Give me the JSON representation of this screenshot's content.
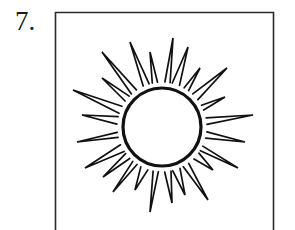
{
  "item": {
    "number_label": "7."
  },
  "figure": {
    "icon": "sun-icon",
    "frame": {
      "x": 55,
      "y": 12,
      "width": 218,
      "stroke": "#2a2a2a"
    },
    "sun": {
      "center": [
        162,
        127
      ],
      "radius": 40,
      "stroke": "#111111",
      "ray_count": 24
    }
  }
}
